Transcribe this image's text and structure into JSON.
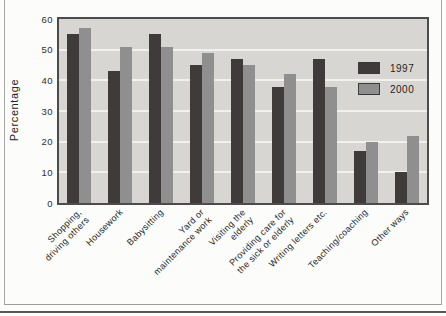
{
  "figure": {
    "ylabel": "Percentage",
    "colors": {
      "series_1997": "#3f3b3a",
      "series_2000": "#8f8f8f",
      "plot_background": "#d7d6d3",
      "gridline": "#f2f1ee",
      "plot_border": "#4c4c4c"
    }
  },
  "chart_data": {
    "type": "bar",
    "title": "",
    "xlabel": "",
    "ylabel": "Percentage",
    "ylim": [
      0,
      60
    ],
    "yticks": [
      0,
      10,
      20,
      30,
      40,
      50,
      60
    ],
    "grid": "horizontal white gridlines at 10,20,30,40,50",
    "legend_position": "upper right inside plot",
    "categories": [
      "Shopping, driving others",
      "Housework",
      "Babysitting",
      "Yard or maintenance work",
      "Visiting the elderly",
      "Providing care for the sick or elderly",
      "Writing letters etc.",
      "Teaching/coaching",
      "Other ways"
    ],
    "category_label_lines": [
      [
        "Shopping,",
        "driving others"
      ],
      [
        "Housework"
      ],
      [
        "Babysitting"
      ],
      [
        "Yard or",
        "maintenance work"
      ],
      [
        "Visiting the",
        "elderly"
      ],
      [
        "Providing care for",
        "the sick or elderly"
      ],
      [
        "Writing letters etc."
      ],
      [
        "Teaching/coaching"
      ],
      [
        "Other ways"
      ]
    ],
    "series": [
      {
        "name": "1997",
        "color": "#3f3b3a",
        "values": [
          55,
          43,
          55,
          45,
          47,
          38,
          47,
          17,
          10
        ]
      },
      {
        "name": "2000",
        "color": "#8f8f8f",
        "values": [
          57,
          51,
          51,
          49,
          45,
          42,
          38,
          20,
          22
        ]
      }
    ]
  }
}
